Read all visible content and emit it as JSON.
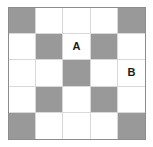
{
  "figure": {
    "rows": 5,
    "columns": 5,
    "colors": {
      "shaded": "#999999",
      "blank": "#ffffff",
      "frame_border": "#8d8d8d",
      "grid_line": "#d9d9d9",
      "label_text": "#1a1a1a",
      "page_background": "#ffffff"
    },
    "labels": {
      "a": "A",
      "b": "B"
    },
    "cells": [
      [
        {
          "state": "shaded",
          "label": ""
        },
        {
          "state": "blank",
          "label": ""
        },
        {
          "state": "blank",
          "label": ""
        },
        {
          "state": "blank",
          "label": ""
        },
        {
          "state": "shaded",
          "label": ""
        }
      ],
      [
        {
          "state": "blank",
          "label": ""
        },
        {
          "state": "shaded",
          "label": ""
        },
        {
          "state": "blank",
          "label": "A"
        },
        {
          "state": "shaded",
          "label": ""
        },
        {
          "state": "blank",
          "label": ""
        }
      ],
      [
        {
          "state": "blank",
          "label": ""
        },
        {
          "state": "blank",
          "label": ""
        },
        {
          "state": "shaded",
          "label": ""
        },
        {
          "state": "blank",
          "label": ""
        },
        {
          "state": "blank",
          "label": "B"
        }
      ],
      [
        {
          "state": "blank",
          "label": ""
        },
        {
          "state": "shaded",
          "label": ""
        },
        {
          "state": "blank",
          "label": ""
        },
        {
          "state": "shaded",
          "label": ""
        },
        {
          "state": "blank",
          "label": ""
        }
      ],
      [
        {
          "state": "shaded",
          "label": ""
        },
        {
          "state": "blank",
          "label": ""
        },
        {
          "state": "blank",
          "label": ""
        },
        {
          "state": "blank",
          "label": ""
        },
        {
          "state": "shaded",
          "label": ""
        }
      ]
    ]
  }
}
